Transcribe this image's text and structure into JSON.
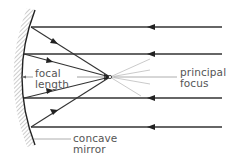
{
  "diagram": {
    "type": "ray-diagram",
    "labels": {
      "focal_length": [
        "focal",
        "length"
      ],
      "principal_focus": [
        "principal",
        "focus"
      ],
      "concave_mirror": [
        "concave",
        "mirror"
      ]
    },
    "incident_rays_y": [
      27,
      54,
      98,
      127
    ],
    "principal_axis_y": 77,
    "focus_point": {
      "x": 110,
      "y": 77
    },
    "colors": {
      "ray": "#333333",
      "mirror": "#222222",
      "hatching": "#9a9a9a",
      "leader_line": "#888888",
      "label_text": "#555555",
      "background": "#ffffff"
    }
  }
}
